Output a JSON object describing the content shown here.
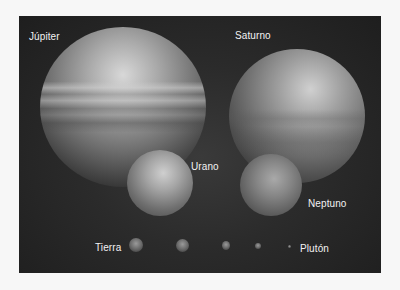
{
  "figure": {
    "labels": {
      "jupiter": "Júpiter",
      "saturn": "Saturno",
      "uranus": "Urano",
      "neptune": "Neptuno",
      "earth": "Tierra",
      "pluto": "Plutón"
    },
    "colors": {
      "background": "#2b2b2b",
      "page": "#f7f7f7",
      "label_text": "#f2f2f2"
    }
  }
}
